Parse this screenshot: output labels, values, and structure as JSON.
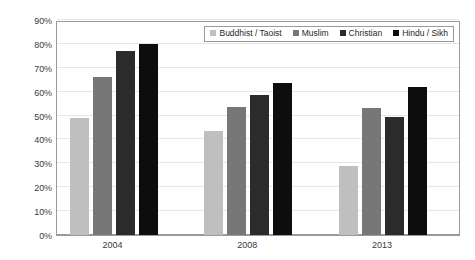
{
  "chart_data": {
    "type": "bar",
    "title": "",
    "subtitle": "",
    "xlabel": "",
    "ylabel": "",
    "categories": [
      "2004",
      "2008",
      "2013"
    ],
    "ylim": [
      0,
      90
    ],
    "ytick_values": [
      0,
      10,
      20,
      30,
      40,
      50,
      60,
      70,
      80,
      90
    ],
    "ytick_labels": [
      "0%",
      "10%",
      "20%",
      "30%",
      "40%",
      "50%",
      "60%",
      "70%",
      "80%",
      "90%"
    ],
    "xtick_labels": [
      "2004",
      "2008",
      "2013"
    ],
    "grid": true,
    "grid_axis": "y",
    "legend_position": "top-right-inside",
    "value_suffix": "%",
    "series": [
      {
        "name": "Buddhist / Taoist",
        "color": "#bfbfbf",
        "values": [
          49.0,
          43.5,
          29.0
        ]
      },
      {
        "name": "Muslim",
        "color": "#777777",
        "values": [
          66.0,
          53.5,
          53.0
        ]
      },
      {
        "name": "Christian",
        "color": "#2b2b2b",
        "values": [
          77.0,
          58.5,
          49.5
        ]
      },
      {
        "name": "Hindu / Sikh",
        "color": "#0d0d0d",
        "values": [
          80.0,
          63.5,
          62.0
        ]
      }
    ]
  },
  "style": {
    "plot_background": "#ffffff",
    "page_background": "#ffffff",
    "grid_color": "#e6e6e6",
    "axis_color": "#9a9a9a",
    "tick_label_color": "#3a3a3a",
    "legend_border_color": "#9a9a9a",
    "legend_text_color": "#1f1f1f"
  }
}
